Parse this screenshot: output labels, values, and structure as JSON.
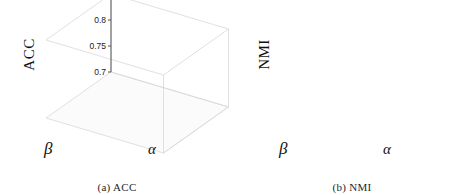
{
  "figure": {
    "panels": [
      {
        "id": "acc",
        "caption": "(a) ACC",
        "zlabel": "ACC",
        "xlabel": "α",
        "ylabel": "β",
        "zticks": [
          "0.7",
          "0.75",
          "0.8",
          "0.85"
        ],
        "xticks": [
          "10",
          "30",
          "50",
          "70",
          "90"
        ],
        "yticks": [
          "0.01",
          "0.03",
          "0.05",
          "0.07",
          "0.09"
        ]
      },
      {
        "id": "nmi",
        "caption": "(b) NMI",
        "zlabel": "NMI",
        "xlabel": "α",
        "ylabel": "β",
        "zticks": [
          "0.7",
          "0.8",
          "0.9"
        ],
        "xticks": [
          "10",
          "30",
          "50",
          "70",
          "90"
        ],
        "yticks": [
          "0.01",
          "0.03",
          "0.05",
          "0.07",
          "0.09"
        ]
      }
    ],
    "colors": {
      "background": "#ffffff",
      "axis_line": "#555555",
      "box_line": "#d8d8d8",
      "bar_edge": "#2b2b2b",
      "text": "#1a1a1a",
      "column_greys": [
        "#3a3a3a",
        "#5c5c5c",
        "#787878",
        "#a8a8a8",
        "#cfcfcf"
      ]
    }
  },
  "chart_data": [
    {
      "type": "bar",
      "id": "acc",
      "title": "(a) ACC",
      "xlabel": "α",
      "ylabel": "β",
      "zlabel": "ACC",
      "x": [
        10,
        30,
        50,
        70,
        90
      ],
      "y": [
        0.01,
        0.03,
        0.05,
        0.07,
        0.09
      ],
      "zlim": [
        0.7,
        0.85
      ],
      "zticks": [
        0.7,
        0.75,
        0.8,
        0.85
      ],
      "grid": false,
      "legend": "none",
      "note": "z[beta_index][alpha_index]; rows are beta = 0.01..0.09, columns are alpha = 10..90",
      "z": [
        [
          0.805,
          0.828,
          0.845,
          0.822,
          0.818
        ],
        [
          0.8,
          0.82,
          0.83,
          0.818,
          0.815
        ],
        [
          0.797,
          0.812,
          0.822,
          0.812,
          0.81
        ],
        [
          0.793,
          0.806,
          0.815,
          0.808,
          0.806
        ],
        [
          0.79,
          0.8,
          0.81,
          0.804,
          0.802
        ]
      ]
    },
    {
      "type": "bar",
      "id": "nmi",
      "title": "(b) NMI",
      "xlabel": "α",
      "ylabel": "β",
      "zlabel": "NMI",
      "x": [
        10,
        30,
        50,
        70,
        90
      ],
      "y": [
        0.01,
        0.03,
        0.05,
        0.07,
        0.09
      ],
      "zlim": [
        0.7,
        0.9
      ],
      "zticks": [
        0.7,
        0.8,
        0.9
      ],
      "grid": false,
      "legend": "none",
      "note": "z[beta_index][alpha_index]; rows are beta = 0.01..0.09, columns are alpha = 10..90",
      "z": [
        [
          0.822,
          0.862,
          0.885,
          0.858,
          0.852
        ],
        [
          0.816,
          0.852,
          0.868,
          0.85,
          0.845
        ],
        [
          0.812,
          0.842,
          0.856,
          0.843,
          0.84
        ],
        [
          0.808,
          0.834,
          0.846,
          0.838,
          0.834
        ],
        [
          0.805,
          0.826,
          0.838,
          0.832,
          0.828
        ]
      ]
    }
  ]
}
